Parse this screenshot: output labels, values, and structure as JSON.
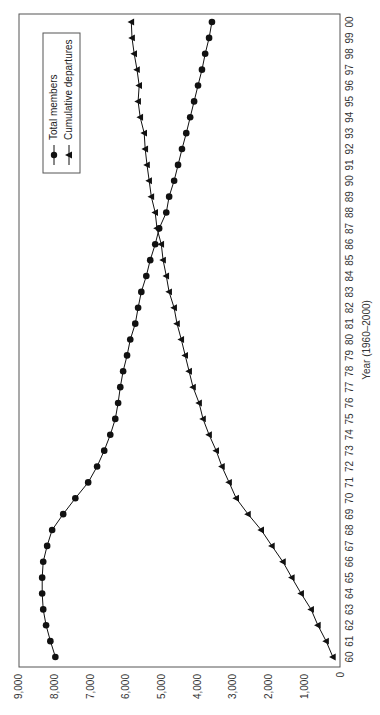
{
  "chart_data": {
    "type": "line",
    "orientation": "rotated-90-ccw",
    "title": "",
    "xlabel": "Year (1960–2000)",
    "ylabel": "",
    "x": [
      "60",
      "61",
      "62",
      "63",
      "64",
      "65",
      "66",
      "67",
      "68",
      "69",
      "70",
      "71",
      "72",
      "73",
      "74",
      "75",
      "76",
      "77",
      "78",
      "79",
      "80",
      "81",
      "82",
      "83",
      "84",
      "85",
      "86",
      "87",
      "88",
      "89",
      "90",
      "91",
      "92",
      "93",
      "94",
      "95",
      "96",
      "97",
      "98",
      "99",
      "00"
    ],
    "ylim": [
      0,
      9000
    ],
    "yticks": [
      0,
      1000,
      2000,
      3000,
      4000,
      5000,
      6000,
      7000,
      8000,
      9000
    ],
    "ytick_labels": [
      "0",
      "1,000",
      "2,000",
      "3,000",
      "4,000",
      "5,000",
      "6,000",
      "7,000",
      "8,000",
      "9,000"
    ],
    "grid": false,
    "legend_position": "upper-left (rotated view: top-right)",
    "series": [
      {
        "name": "Total members",
        "marker": "circle",
        "values": [
          7980,
          8120,
          8240,
          8320,
          8350,
          8350,
          8320,
          8210,
          8070,
          7760,
          7420,
          7060,
          6810,
          6610,
          6440,
          6300,
          6220,
          6160,
          6080,
          5970,
          5880,
          5740,
          5660,
          5570,
          5430,
          5320,
          5180,
          5070,
          4870,
          4790,
          4650,
          4540,
          4430,
          4310,
          4200,
          4090,
          3980,
          3870,
          3780,
          3670,
          3590
        ]
      },
      {
        "name": "Cumulative departures",
        "marker": "triangle",
        "values": [
          200,
          390,
          620,
          810,
          1090,
          1350,
          1600,
          1910,
          2210,
          2580,
          2910,
          3110,
          3310,
          3470,
          3670,
          3840,
          3950,
          4120,
          4230,
          4340,
          4450,
          4570,
          4650,
          4790,
          4870,
          4960,
          5010,
          5130,
          5180,
          5290,
          5350,
          5410,
          5460,
          5490,
          5600,
          5660,
          5630,
          5690,
          5770,
          5830,
          5850
        ]
      }
    ]
  },
  "legend": {
    "items": [
      "Total members",
      "Cumulative departures"
    ]
  }
}
